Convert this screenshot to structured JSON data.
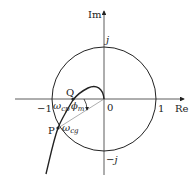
{
  "axes": {
    "real_label": "Re",
    "imag_label": "Im",
    "origin_label": "0",
    "tick_minus_one": "−1",
    "tick_one": "1",
    "tick_j": "j",
    "tick_minus_j": "−j"
  },
  "points": {
    "Q": {
      "label": "Q",
      "freq_label": "ω",
      "freq_sub": "cp"
    },
    "P": {
      "label": "P",
      "freq_label": "ω",
      "freq_sub": "cg"
    }
  },
  "angle": {
    "label": "ϕ",
    "sub": "m"
  },
  "colors": {
    "stroke": "#222222",
    "thin": "#555555"
  }
}
